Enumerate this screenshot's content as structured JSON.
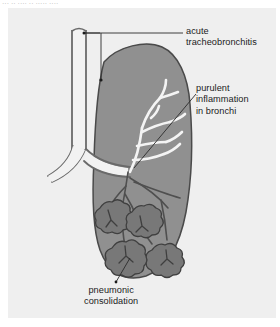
{
  "figure": {
    "type": "medical-illustration",
    "cut_off_header_text": "··· ·· ···· ·· ····· ····"
  },
  "labels": {
    "acute": "acute\ntracheobronchitis",
    "purulent": "purulent\ninflammation\nin bronchi",
    "pneumonic": "pneumonic\nconsolidation"
  },
  "colors": {
    "page_background": "#ffffff",
    "panel_background": "#efefef",
    "lung_fill": "#909090",
    "lung_outline": "#4a4a4a",
    "consolidation_fill": "#787878",
    "consolidation_outline": "#3f3f3f",
    "airway_fill": "#f2f2f2",
    "airway_outline": "#6a6a6a",
    "bronchus_dark": "#4f4f4f",
    "leader_line": "#2b2b2b",
    "text": "#1b1b1b"
  },
  "anatomy": {
    "trachea": "vertical white airway at upper left with dark walls",
    "carina": "bifurcation into left and right main bronchi",
    "left_main_bronchus": "branch running down-left out of the lung",
    "right_main_bronchus": "branch entering the shaded lung",
    "inflamed_bronchial_tree": "white branching tree inside upper lung",
    "consolidation_lobules": 4
  }
}
